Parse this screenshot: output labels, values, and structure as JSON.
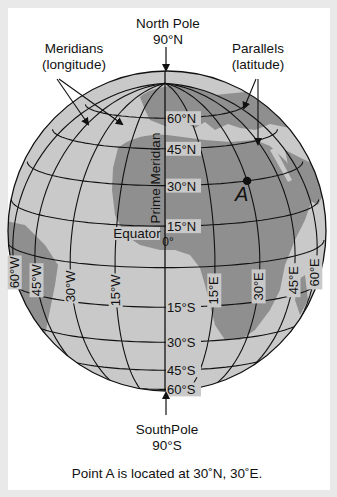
{
  "title_labels": {
    "north_pole": "North Pole",
    "north_pole_lat": "90°N",
    "south_pole": "SouthPole",
    "south_pole_lat": "90°S",
    "meridians_line1": "Meridians",
    "meridians_line2": "(longitude)",
    "parallels_line1": "Parallels",
    "parallels_line2": "(latitude)",
    "prime_meridian": "Prime Meridian",
    "equator": "Equator",
    "equator_value": "0°",
    "point_label": "A"
  },
  "caption": "Point A is located at 30˚N, 30˚E.",
  "parallels": [
    {
      "lat": 60,
      "label": "60°N"
    },
    {
      "lat": 45,
      "label": "45°N"
    },
    {
      "lat": 30,
      "label": "30°N"
    },
    {
      "lat": 15,
      "label": "15°N"
    },
    {
      "lat": -15,
      "label": "15°S"
    },
    {
      "lat": -30,
      "label": "30°S"
    },
    {
      "lat": -45,
      "label": "45°S"
    },
    {
      "lat": -60,
      "label": "60°S"
    }
  ],
  "meridians": [
    {
      "lon": -60,
      "label": "60°W"
    },
    {
      "lon": -45,
      "label": "45°W"
    },
    {
      "lon": -30,
      "label": "30°W"
    },
    {
      "lon": -15,
      "label": "15°W"
    },
    {
      "lon": 15,
      "label": "15°E"
    },
    {
      "lon": 30,
      "label": "30°E"
    },
    {
      "lon": 45,
      "label": "45°E"
    },
    {
      "lon": 60,
      "label": "60°E"
    }
  ],
  "point_a": {
    "lat": 30,
    "lon": 30
  },
  "colors": {
    "ocean": "#c9c9c9",
    "land": "#8f8f8f",
    "land_light": "#b4b4b4",
    "grid": "#111111",
    "frame": "#e9e9e9"
  }
}
